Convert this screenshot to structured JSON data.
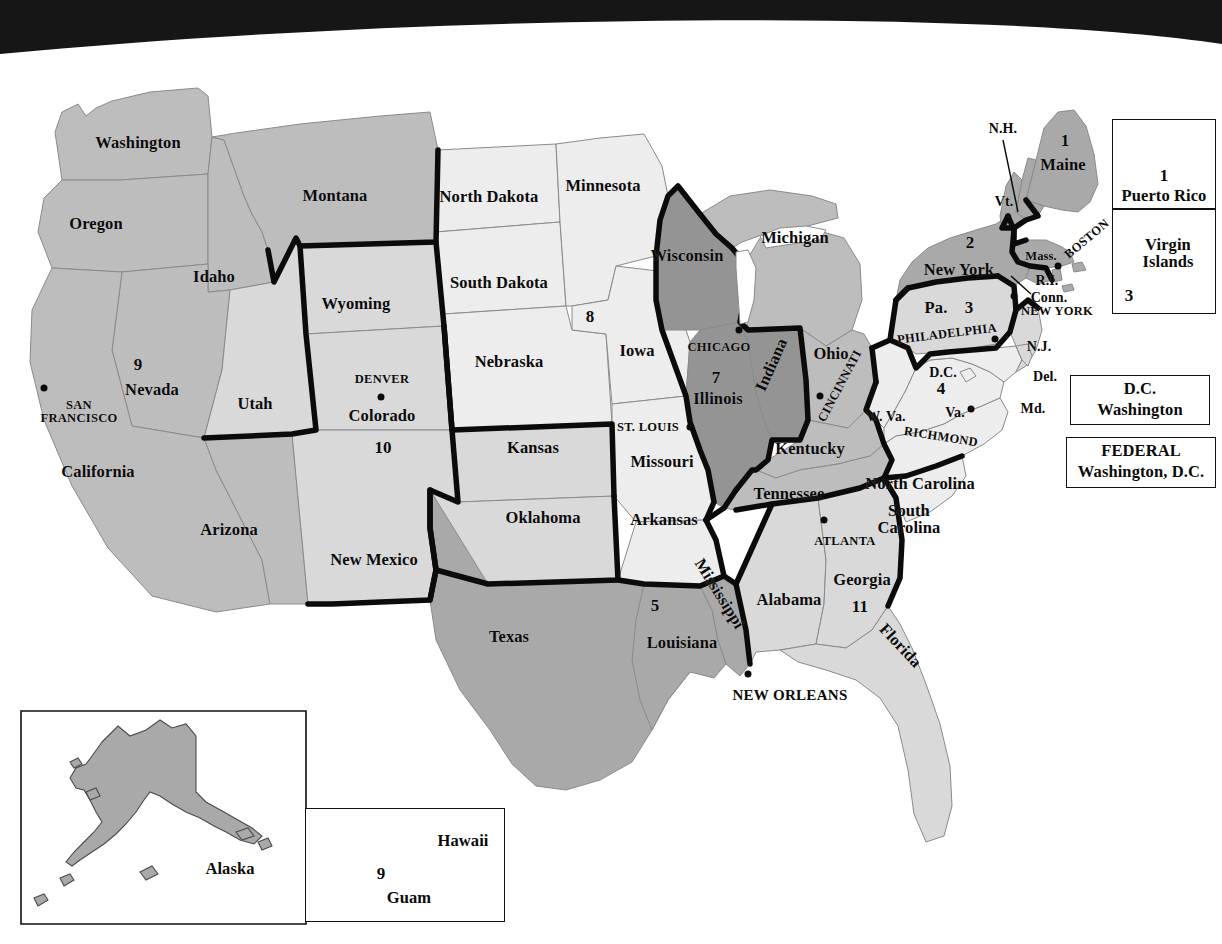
{
  "figure": {
    "kind": "map",
    "scan_artifact": "black-curved-banner-top"
  },
  "palette": {
    "page_background": "#ffffff",
    "ink": "#0b0b0b",
    "banner_black": "#161616",
    "fill_light": "#ededed",
    "fill_pale": "#d9d9d9",
    "fill_medium": "#bdbdbd",
    "fill_gray": "#a9a9a9",
    "fill_dark": "#949494",
    "hairline": "#8a8a8a",
    "circuit_border": "#0b0b0b"
  },
  "circuits": [
    {
      "number": "1",
      "seat": "Boston",
      "fill": "#a9a9a9"
    },
    {
      "number": "2",
      "seat": "New York",
      "fill": "#a9a9a9"
    },
    {
      "number": "3",
      "seat": "Philadelphia",
      "fill": "#d9d9d9"
    },
    {
      "number": "4",
      "seat": "Richmond",
      "fill": "#ededed"
    },
    {
      "number": "5",
      "seat": "New Orleans",
      "fill": "#a9a9a9"
    },
    {
      "number": "6",
      "seat": "Cincinnati",
      "fill": "#bdbdbd"
    },
    {
      "number": "7",
      "seat": "Chicago",
      "fill": "#949494"
    },
    {
      "number": "8",
      "seat": "St. Louis",
      "fill": "#ededed"
    },
    {
      "number": "9",
      "seat": "San Francisco",
      "fill": "#bdbdbd"
    },
    {
      "number": "10",
      "seat": "Denver",
      "fill": "#d9d9d9"
    },
    {
      "number": "11",
      "seat": "Atlanta",
      "fill": "#d9d9d9"
    }
  ],
  "states": [
    {
      "name": "Washington",
      "x": 138,
      "y": 143,
      "size": "state"
    },
    {
      "name": "Oregon",
      "x": 96,
      "y": 224,
      "size": "state"
    },
    {
      "name": "Idaho",
      "x": 214,
      "y": 277,
      "size": "state"
    },
    {
      "name": "Montana",
      "x": 335,
      "y": 196,
      "size": "state"
    },
    {
      "name": "Wyoming",
      "x": 356,
      "y": 304,
      "size": "state"
    },
    {
      "name": "Nevada",
      "x": 152,
      "y": 390,
      "size": "state"
    },
    {
      "name": "Utah",
      "x": 255,
      "y": 404,
      "size": "state"
    },
    {
      "name": "Colorado",
      "x": 382,
      "y": 416,
      "size": "state"
    },
    {
      "name": "California",
      "x": 98,
      "y": 472,
      "size": "state"
    },
    {
      "name": "Arizona",
      "x": 229,
      "y": 530,
      "size": "state"
    },
    {
      "name": "New Mexico",
      "x": 374,
      "y": 560,
      "size": "state"
    },
    {
      "name": "North Dakota",
      "x": 489,
      "y": 197,
      "size": "state"
    },
    {
      "name": "South Dakota",
      "x": 499,
      "y": 283,
      "size": "state"
    },
    {
      "name": "Nebraska",
      "x": 509,
      "y": 362,
      "size": "state"
    },
    {
      "name": "Kansas",
      "x": 533,
      "y": 448,
      "size": "state"
    },
    {
      "name": "Oklahoma",
      "x": 543,
      "y": 518,
      "size": "state"
    },
    {
      "name": "Texas",
      "x": 509,
      "y": 637,
      "size": "state"
    },
    {
      "name": "Minnesota",
      "x": 603,
      "y": 186,
      "size": "state"
    },
    {
      "name": "Iowa",
      "x": 637,
      "y": 351,
      "size": "state"
    },
    {
      "name": "Missouri",
      "x": 662,
      "y": 462,
      "size": "state"
    },
    {
      "name": "Arkansas",
      "x": 664,
      "y": 520,
      "size": "state"
    },
    {
      "name": "Louisiana",
      "x": 682,
      "y": 643,
      "size": "state"
    },
    {
      "name": "Wisconsin",
      "x": 687,
      "y": 256,
      "size": "state"
    },
    {
      "name": "Illinois",
      "x": 718,
      "y": 399,
      "size": "state"
    },
    {
      "name": "Michigan",
      "x": 795,
      "y": 238,
      "size": "state"
    },
    {
      "name": "Indiana",
      "x": 772,
      "y": 365,
      "size": "state",
      "rot": "rot-ind"
    },
    {
      "name": "Ohio",
      "x": 831,
      "y": 354,
      "size": "state"
    },
    {
      "name": "Kentucky",
      "x": 810,
      "y": 449,
      "size": "state"
    },
    {
      "name": "Tennessee",
      "x": 789,
      "y": 494,
      "size": "state"
    },
    {
      "name": "Mississippi",
      "x": 719,
      "y": 594,
      "size": "state",
      "rot": "rot-miss"
    },
    {
      "name": "Alabama",
      "x": 789,
      "y": 600,
      "size": "state"
    },
    {
      "name": "Georgia",
      "x": 862,
      "y": 580,
      "size": "state"
    },
    {
      "name": "Florida",
      "x": 900,
      "y": 646,
      "size": "state",
      "rot": "rot-fla"
    },
    {
      "name": "South\nCarolina",
      "x": 909,
      "y": 519,
      "size": "state",
      "two": true
    },
    {
      "name": "North Carolina",
      "x": 920,
      "y": 484,
      "size": "state"
    },
    {
      "name": "W. Va.",
      "x": 886,
      "y": 417,
      "size": "state sm"
    },
    {
      "name": "Va.",
      "x": 955,
      "y": 413,
      "size": "state sm"
    },
    {
      "name": "Md.",
      "x": 1033,
      "y": 409,
      "size": "state sm"
    },
    {
      "name": "Del.",
      "x": 1045,
      "y": 377,
      "size": "state sm"
    },
    {
      "name": "D.C.",
      "x": 943,
      "y": 373,
      "size": "state sm"
    },
    {
      "name": "N.J.",
      "x": 1039,
      "y": 347,
      "size": "state sm"
    },
    {
      "name": "Pa.",
      "x": 936,
      "y": 308,
      "size": "state"
    },
    {
      "name": "New York",
      "x": 959,
      "y": 270,
      "size": "state"
    },
    {
      "name": "Conn.",
      "x": 1049,
      "y": 298,
      "size": "state sm"
    },
    {
      "name": "R.I.",
      "x": 1047,
      "y": 281,
      "size": "state sm"
    },
    {
      "name": "Mass.",
      "x": 1041,
      "y": 256,
      "size": "state xs"
    },
    {
      "name": "Vt.",
      "x": 1004,
      "y": 202,
      "size": "state sm"
    },
    {
      "name": "N.H.",
      "x": 1003,
      "y": 129,
      "size": "state sm"
    },
    {
      "name": "Maine",
      "x": 1063,
      "y": 165,
      "size": "state"
    }
  ],
  "circuit_numbers_on_map": [
    {
      "n": "1",
      "x": 1065,
      "y": 141
    },
    {
      "n": "2",
      "x": 970,
      "y": 243
    },
    {
      "n": "3",
      "x": 969,
      "y": 308
    },
    {
      "n": "4",
      "x": 941,
      "y": 389
    },
    {
      "n": "5",
      "x": 655,
      "y": 606
    },
    {
      "n": "7",
      "x": 716,
      "y": 378
    },
    {
      "n": "8",
      "x": 590,
      "y": 317
    },
    {
      "n": "9",
      "x": 138,
      "y": 365
    },
    {
      "n": "10",
      "x": 383,
      "y": 448
    },
    {
      "n": "11",
      "x": 860,
      "y": 607
    }
  ],
  "cities": [
    {
      "name": "SAN\nFRANCISCO",
      "x": 79,
      "y": 412,
      "dot_x": 44,
      "dot_y": 388,
      "two": true
    },
    {
      "name": "DENVER",
      "x": 382,
      "y": 379,
      "dot_x": 381,
      "dot_y": 397
    },
    {
      "name": "ST. LOUIS",
      "x": 648,
      "y": 427,
      "dot_x": 690,
      "dot_y": 427
    },
    {
      "name": "CHICAGO",
      "x": 719,
      "y": 347,
      "dot_x": 739,
      "dot_y": 330
    },
    {
      "name": "CINCINNATI",
      "x": 840,
      "y": 386,
      "dot_x": 820,
      "dot_y": 396,
      "rot": "rot-cin"
    },
    {
      "name": "PHILADELPHIA",
      "x": 947,
      "y": 334,
      "dot_x": 995,
      "dot_y": 339,
      "rot": "rot-phil"
    },
    {
      "name": "NEW YORK",
      "x": 1057,
      "y": 311,
      "dot_x": 1014,
      "dot_y": 296
    },
    {
      "name": "BOSTON",
      "x": 1087,
      "y": 239,
      "dot_x": 1058,
      "dot_y": 266,
      "rot": "rot-bos"
    },
    {
      "name": "RICHMOND",
      "x": 941,
      "y": 437,
      "dot_x": 971,
      "dot_y": 409,
      "rot": "rot-rich"
    },
    {
      "name": "ATLANTA",
      "x": 845,
      "y": 541,
      "dot_x": 824,
      "dot_y": 520
    },
    {
      "name": "NEW ORLEANS",
      "x": 790,
      "y": 696,
      "dot_x": 748,
      "dot_y": 674,
      "big": true
    }
  ],
  "legend_boxes": [
    {
      "id": "puerto-rico",
      "title": "Puerto Rico",
      "number": "1",
      "x": 1112,
      "y": 119,
      "w": 104,
      "h": 90
    },
    {
      "id": "virgin-islands",
      "title": "Virgin\nIslands",
      "number": "3",
      "x": 1112,
      "y": 209,
      "w": 104,
      "h": 105
    },
    {
      "id": "dc-circuit",
      "line1": "D.C.",
      "line2": "Washington",
      "x": 1070,
      "y": 375,
      "w": 140,
      "h": 50
    },
    {
      "id": "federal-circuit",
      "line1": "FEDERAL",
      "line2": "Washington, D.C.",
      "x": 1066,
      "y": 437,
      "w": 150,
      "h": 51
    }
  ],
  "insets": [
    {
      "id": "alaska",
      "label": "Alaska",
      "label_x": 230,
      "label_y": 869,
      "x": 20,
      "y": 710,
      "w": 280,
      "h": 212
    },
    {
      "id": "hawaii-guam",
      "label_hawaii": "Hawaii",
      "label_guam": "Guam",
      "number": "9",
      "hawaii_x": 463,
      "hawaii_y": 841,
      "guam_x": 409,
      "guam_y": 898,
      "num_x": 381,
      "num_y": 874,
      "x": 305,
      "y": 808,
      "w": 200,
      "h": 114
    }
  ]
}
